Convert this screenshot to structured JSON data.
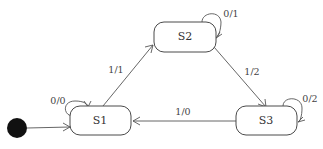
{
  "diagram": {
    "type": "state-machine",
    "initial_state": "S1",
    "states": [
      {
        "id": "S1",
        "label": "S1"
      },
      {
        "id": "S2",
        "label": "S2"
      },
      {
        "id": "S3",
        "label": "S3"
      }
    ],
    "transitions": [
      {
        "from": "S1",
        "to": "S1",
        "label": "0/0"
      },
      {
        "from": "S1",
        "to": "S2",
        "label": "1/1"
      },
      {
        "from": "S2",
        "to": "S2",
        "label": "0/1"
      },
      {
        "from": "S2",
        "to": "S3",
        "label": "1/2"
      },
      {
        "from": "S3",
        "to": "S3",
        "label": "0/2"
      },
      {
        "from": "S3",
        "to": "S1",
        "label": "1/0"
      }
    ],
    "colors": {
      "stroke": "#4a4a4a",
      "initial_fill": "#111111",
      "background": "#ffffff"
    }
  }
}
